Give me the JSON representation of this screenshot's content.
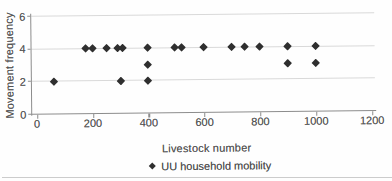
{
  "chart_data": {
    "type": "scatter",
    "xlabel": "Livestock number",
    "ylabel": "Movement frequency",
    "xlim": [
      0,
      1200
    ],
    "ylim": [
      0,
      6
    ],
    "x_ticks": [
      0,
      200,
      400,
      600,
      800,
      1000,
      1200
    ],
    "y_ticks": [
      0,
      2,
      4,
      6
    ],
    "grid": "horizontal",
    "legend": {
      "position": "bottom",
      "label": "UU household mobility",
      "marker": "diamond"
    },
    "series": [
      {
        "name": "UU household mobility",
        "marker": "diamond",
        "color": "#2f2f2f",
        "points": [
          [
            60,
            2
          ],
          [
            175,
            4
          ],
          [
            200,
            4
          ],
          [
            250,
            4
          ],
          [
            290,
            4
          ],
          [
            300,
            2
          ],
          [
            310,
            4
          ],
          [
            400,
            2
          ],
          [
            400,
            3
          ],
          [
            400,
            4
          ],
          [
            495,
            4
          ],
          [
            520,
            4
          ],
          [
            600,
            4
          ],
          [
            700,
            4
          ],
          [
            745,
            4
          ],
          [
            800,
            4
          ],
          [
            900,
            3
          ],
          [
            900,
            4
          ],
          [
            1000,
            3
          ],
          [
            1000,
            4
          ]
        ]
      }
    ]
  },
  "colors": {
    "marker": "#2f2f2f",
    "gridline": "#d9d9d9",
    "axis": "#8c8c8c",
    "text": "#4f4f4f",
    "rule": "#cccccc"
  }
}
